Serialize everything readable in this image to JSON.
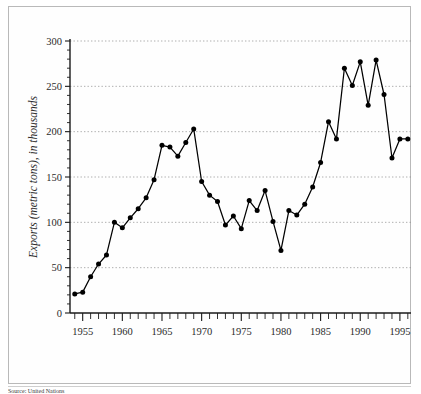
{
  "figure": {
    "caption_fragment": "Source: United Nations"
  },
  "chart_data": {
    "type": "line",
    "title": "",
    "xlabel": "",
    "ylabel": "Exports (metric tons), in thousands",
    "xlim": [
      1953.4,
      1996.4
    ],
    "ylim": [
      0,
      300
    ],
    "grid": true,
    "legend": "none",
    "y_ticks": [
      0,
      50,
      100,
      150,
      200,
      250,
      300
    ],
    "y_tick_labels": [
      "0",
      "50",
      "100",
      "150",
      "200",
      "250",
      "300"
    ],
    "x_tick_labels": [
      "1955",
      "1960",
      "1965",
      "1970",
      "1975",
      "1980",
      "1985",
      "1990",
      "1995"
    ],
    "x_ticks_labeled": [
      1955,
      1960,
      1965,
      1970,
      1975,
      1980,
      1985,
      1990,
      1995
    ],
    "x_ticks_minor_start": 1954,
    "x_ticks_minor_end": 1996,
    "marker": "filled-circle",
    "line_color": "#000000",
    "marker_color": "#000000",
    "x": [
      1954,
      1955,
      1956,
      1957,
      1958,
      1959,
      1960,
      1961,
      1962,
      1963,
      1964,
      1965,
      1966,
      1967,
      1968,
      1969,
      1970,
      1971,
      1972,
      1973,
      1974,
      1975,
      1976,
      1977,
      1978,
      1979,
      1980,
      1981,
      1982,
      1983,
      1984,
      1985,
      1986,
      1987,
      1988,
      1989,
      1990,
      1991,
      1992,
      1993,
      1994,
      1995,
      1996
    ],
    "values": [
      21,
      23,
      40,
      54,
      64,
      100,
      94,
      105,
      115,
      127,
      147,
      185,
      183,
      173,
      188,
      203,
      145,
      130,
      123,
      97,
      107,
      93,
      124,
      113,
      135,
      101,
      69,
      113,
      108,
      120,
      139,
      166,
      211,
      192,
      270,
      251,
      277,
      229,
      279,
      241,
      171,
      192,
      192
    ]
  }
}
